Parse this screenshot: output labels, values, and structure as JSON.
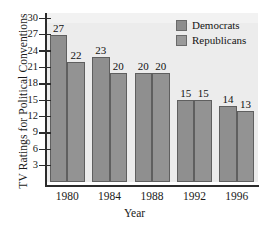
{
  "chart_data": {
    "type": "bar",
    "title": "",
    "ylabel": "TV Ratings for Political Conventions",
    "xlabel": "Year",
    "categories": [
      "1980",
      "1984",
      "1988",
      "1992",
      "1996"
    ],
    "series": [
      {
        "name": "Democrats",
        "values": [
          27,
          23,
          20,
          15,
          14
        ]
      },
      {
        "name": "Republicans",
        "values": [
          22,
          20,
          20,
          15,
          13
        ]
      }
    ],
    "ylim": [
      0,
      31
    ],
    "yticks": [
      3,
      6,
      9,
      12,
      15,
      18,
      21,
      24,
      27,
      30
    ],
    "ytick_labels": [
      "3",
      "6",
      "9",
      "12",
      "15",
      "18",
      "21",
      "24",
      "27",
      "30"
    ],
    "grid": false,
    "legend_position": "top-right",
    "colors": {
      "democrats": "#8f8f8f",
      "republicans": "#939393",
      "plot_background": "#ececec",
      "axis": "#2b2b2b",
      "text": "#1a1a1a"
    },
    "bar_labels": [
      "27",
      "22",
      "23",
      "20",
      "20",
      "20",
      "15",
      "15",
      "14",
      "13"
    ]
  },
  "legend": {
    "items": [
      {
        "label": "Democrats"
      },
      {
        "label": "Republicans"
      }
    ]
  },
  "axes": {
    "y_title": "TV Ratings for Political Conventions",
    "x_title": "Year"
  }
}
